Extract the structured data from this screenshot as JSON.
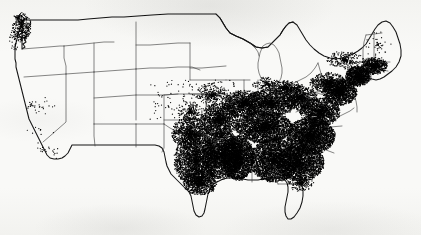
{
  "figure": {
    "title": "",
    "caption": "",
    "width": 421,
    "height": 235,
    "background_color": "#fbfbfa",
    "dot_color": "#000000",
    "national_border_color": "#141414",
    "state_border_color": "#3c3c3c"
  },
  "chart_data": {
    "type": "scatter",
    "title": "",
    "subtitle": "",
    "xlabel": "",
    "ylabel": "",
    "map_projection": "contiguous United States outline",
    "symbol": "dot",
    "dot_color": "#000000",
    "dot_radius_px": 0.62,
    "legend": [],
    "annotations": [],
    "density_regions": [
      {
        "name": "puget-sound-washington",
        "cx": 22,
        "cy": 27,
        "rx": 9,
        "ry": 14,
        "count": 300,
        "falloff": 0.55
      },
      {
        "name": "western-washington-coast",
        "cx": 15,
        "cy": 40,
        "rx": 6,
        "ry": 10,
        "count": 40,
        "falloff": 0.9
      },
      {
        "name": "california-bay-area",
        "cx": 31,
        "cy": 106,
        "rx": 7,
        "ry": 7,
        "count": 16,
        "falloff": 1.0
      },
      {
        "name": "california-central-valley",
        "cx": 43,
        "cy": 108,
        "rx": 13,
        "ry": 12,
        "count": 14,
        "falloff": 1.1
      },
      {
        "name": "california-southern",
        "cx": 53,
        "cy": 152,
        "rx": 14,
        "ry": 9,
        "count": 18,
        "falloff": 1.1
      },
      {
        "name": "california-coast-scatter",
        "cx": 40,
        "cy": 130,
        "rx": 16,
        "ry": 20,
        "count": 12,
        "falloff": 1.2
      },
      {
        "name": "east-texas",
        "cx": 196,
        "cy": 160,
        "rx": 22,
        "ry": 26,
        "count": 2300,
        "falloff": 0.72
      },
      {
        "name": "texas-gulf-coast",
        "cx": 200,
        "cy": 182,
        "rx": 17,
        "ry": 13,
        "count": 900,
        "falloff": 0.8
      },
      {
        "name": "north-texas-oklahoma",
        "cx": 190,
        "cy": 133,
        "rx": 18,
        "ry": 16,
        "count": 1000,
        "falloff": 0.85
      },
      {
        "name": "arkansas-louisiana",
        "cx": 222,
        "cy": 155,
        "rx": 20,
        "ry": 24,
        "count": 2600,
        "falloff": 0.7
      },
      {
        "name": "mississippi-delta",
        "cx": 238,
        "cy": 158,
        "rx": 16,
        "ry": 22,
        "count": 2500,
        "falloff": 0.68
      },
      {
        "name": "missouri-ozarks",
        "cx": 219,
        "cy": 120,
        "rx": 19,
        "ry": 17,
        "count": 1500,
        "falloff": 0.8
      },
      {
        "name": "kentucky-tennessee",
        "cx": 264,
        "cy": 127,
        "rx": 28,
        "ry": 16,
        "count": 2600,
        "falloff": 0.7
      },
      {
        "name": "alabama-georgia",
        "cx": 274,
        "cy": 160,
        "rx": 24,
        "ry": 22,
        "count": 3000,
        "falloff": 0.66
      },
      {
        "name": "carolinas",
        "cx": 311,
        "cy": 136,
        "rx": 24,
        "ry": 18,
        "count": 2900,
        "falloff": 0.66
      },
      {
        "name": "southeast-coastal-plain",
        "cx": 300,
        "cy": 163,
        "rx": 24,
        "ry": 18,
        "count": 2200,
        "falloff": 0.7
      },
      {
        "name": "virginia-piedmont",
        "cx": 320,
        "cy": 112,
        "rx": 20,
        "ry": 14,
        "count": 1500,
        "falloff": 0.78
      },
      {
        "name": "ohio-valley",
        "cx": 270,
        "cy": 103,
        "rx": 26,
        "ry": 13,
        "count": 1600,
        "falloff": 0.8
      },
      {
        "name": "illinois-indiana",
        "cx": 243,
        "cy": 104,
        "rx": 20,
        "ry": 14,
        "count": 1200,
        "falloff": 0.85
      },
      {
        "name": "appalachia-west-virginia",
        "cx": 300,
        "cy": 98,
        "rx": 17,
        "ry": 12,
        "count": 900,
        "falloff": 0.9
      },
      {
        "name": "mid-atlantic-corridor",
        "cx": 340,
        "cy": 92,
        "rx": 17,
        "ry": 13,
        "count": 1500,
        "falloff": 0.78
      },
      {
        "name": "new-york-metro",
        "cx": 358,
        "cy": 76,
        "rx": 12,
        "ry": 10,
        "count": 1100,
        "falloff": 0.7
      },
      {
        "name": "southern-new-england",
        "cx": 374,
        "cy": 66,
        "rx": 13,
        "ry": 8,
        "count": 700,
        "falloff": 0.78
      },
      {
        "name": "upstate-new-york",
        "cx": 345,
        "cy": 60,
        "rx": 18,
        "ry": 9,
        "count": 260,
        "falloff": 1.0
      },
      {
        "name": "pennsylvania-interior",
        "cx": 328,
        "cy": 83,
        "rx": 18,
        "ry": 10,
        "count": 700,
        "falloff": 0.88
      },
      {
        "name": "northern-new-england",
        "cx": 378,
        "cy": 45,
        "rx": 14,
        "ry": 14,
        "count": 45,
        "falloff": 1.2
      },
      {
        "name": "lower-michigan-fringe",
        "cx": 267,
        "cy": 84,
        "rx": 14,
        "ry": 7,
        "count": 160,
        "falloff": 1.05
      },
      {
        "name": "iowa-fringe",
        "cx": 212,
        "cy": 95,
        "rx": 16,
        "ry": 10,
        "count": 300,
        "falloff": 1.05
      },
      {
        "name": "kansas-fringe",
        "cx": 190,
        "cy": 112,
        "rx": 12,
        "ry": 12,
        "count": 240,
        "falloff": 1.1
      },
      {
        "name": "north-florida",
        "cx": 300,
        "cy": 183,
        "rx": 13,
        "ry": 8,
        "count": 220,
        "falloff": 1.1
      },
      {
        "name": "great-lakes-south-shore",
        "cx": 285,
        "cy": 88,
        "rx": 18,
        "ry": 7,
        "count": 420,
        "falloff": 0.95
      }
    ],
    "sparse_scatter": {
      "count": 150,
      "bounds": [
        150,
        80,
        240,
        120
      ],
      "note": "light scatter over the eastern Plains margin"
    }
  },
  "geography": {
    "national_outline_name": "contiguous-us-outline",
    "state_outline_name": "state-boundaries",
    "states_visible": [
      "Washington",
      "Oregon",
      "California",
      "Idaho",
      "Nevada",
      "Utah",
      "Arizona",
      "Montana",
      "Wyoming",
      "Colorado",
      "New Mexico",
      "North Dakota",
      "South Dakota",
      "Nebraska",
      "Kansas",
      "Oklahoma",
      "Texas",
      "Minnesota",
      "Iowa",
      "Missouri",
      "Arkansas",
      "Louisiana",
      "Wisconsin",
      "Illinois",
      "Michigan",
      "Indiana",
      "Ohio",
      "Kentucky",
      "Tennessee",
      "Mississippi",
      "Alabama",
      "Georgia",
      "Florida",
      "South Carolina",
      "North Carolina",
      "Virginia",
      "West Virginia",
      "Maryland",
      "Delaware",
      "Pennsylvania",
      "New Jersey",
      "New York",
      "Connecticut",
      "Rhode Island",
      "Massachusetts",
      "Vermont",
      "New Hampshire",
      "Maine"
    ]
  }
}
